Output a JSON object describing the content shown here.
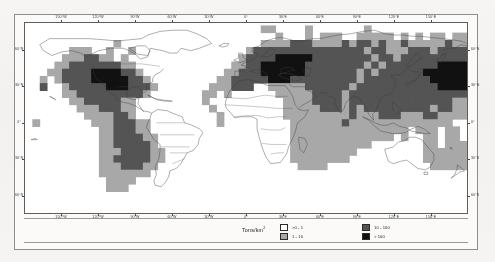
{
  "figure": {
    "legend_title": "Tons/km",
    "legend_title_sup": "2"
  },
  "legend": {
    "columns": [
      {
        "items": [
          {
            "label": ">0 - 1",
            "color": "#ffffff"
          },
          {
            "label": "1 - 10",
            "color": "#a8a8a8"
          }
        ]
      },
      {
        "items": [
          {
            "label": "10 - 100",
            "color": "#545454"
          },
          {
            "label": "> 100",
            "color": "#111111"
          }
        ]
      }
    ]
  },
  "axes": {
    "lon_ticks": [
      {
        "label": "150°W",
        "value": -150
      },
      {
        "label": "120°W",
        "value": -120
      },
      {
        "label": "90°W",
        "value": -90
      },
      {
        "label": "60°W",
        "value": -60
      },
      {
        "label": "30°W",
        "value": -30
      },
      {
        "label": "0°",
        "value": 0
      },
      {
        "label": "30°E",
        "value": 30
      },
      {
        "label": "60°E",
        "value": 60
      },
      {
        "label": "90°E",
        "value": 90
      },
      {
        "label": "120°E",
        "value": 120
      },
      {
        "label": "150°E",
        "value": 150
      }
    ],
    "lat_ticks": [
      {
        "label": "60°N",
        "value": 60
      },
      {
        "label": "30°N",
        "value": 30
      },
      {
        "label": "0°",
        "value": 0
      },
      {
        "label": "30°S",
        "value": -30
      },
      {
        "label": "60°S",
        "value": -60
      }
    ],
    "xlim": [
      -180,
      180
    ],
    "ylim": [
      -75,
      83
    ]
  },
  "chart_data": {
    "type": "heatmap",
    "title": "",
    "subtitle": "",
    "xlabel": "Longitude",
    "ylabel": "Latitude",
    "zlabel": "Tons/km2",
    "grid": true,
    "legend_position": "bottom-center",
    "projection": "equirectangular",
    "cell_size_deg": 6,
    "xlim": [
      -180,
      180
    ],
    "ylim": [
      -75,
      83
    ],
    "classes": [
      {
        "label": ">0 - 1",
        "min": 0,
        "max": 1,
        "color": "#ffffff"
      },
      {
        "label": "1 - 10",
        "min": 1,
        "max": 10,
        "color": "#a8a8a8"
      },
      {
        "label": "10 - 100",
        "min": 10,
        "max": 100,
        "color": "#545454"
      },
      {
        "label": "> 100",
        "min": 100,
        "max": null,
        "color": "#111111"
      }
    ],
    "background_color": "#ffffff",
    "coastline_color": "#3c3c3c",
    "regions": [
      {
        "name": "Eastern North America",
        "class": "> 100"
      },
      {
        "name": "Western Europe",
        "class": "> 100"
      },
      {
        "name": "Central Europe",
        "class": "> 100"
      },
      {
        "name": "Eastern China",
        "class": "> 100"
      },
      {
        "name": "Japan / Korea",
        "class": "> 100"
      },
      {
        "name": "Western North America",
        "class": "10 - 100"
      },
      {
        "name": "Russia / Siberia",
        "class": "10 - 100"
      },
      {
        "name": "India",
        "class": "10 - 100"
      },
      {
        "name": "Middle East",
        "class": "10 - 100"
      },
      {
        "name": "Mexico / Central America",
        "class": "10 - 100"
      },
      {
        "name": "Southeast Asia",
        "class": "10 - 100"
      },
      {
        "name": "Southern Brazil / Argentina",
        "class": "1 - 10"
      },
      {
        "name": "Sub-Saharan Africa",
        "class": "1 - 10"
      },
      {
        "name": "Australia",
        "class": "1 - 10"
      },
      {
        "name": "Amazon Basin",
        "class": ">0 - 1"
      },
      {
        "name": "Sahara",
        "class": ">0 - 1"
      },
      {
        "name": "Greenland",
        "class": ">0 - 1"
      }
    ],
    "grid_rows": [
      {
        "lat": 78,
        "cells": "................................oo....o.......o.............oo....................."
      },
      {
        "lat": 72,
        "cells": "..................................o...o.ooo..ooooo.o.o.oo.ooo......o.o..........."
      },
      {
        "lat": 66,
        "cells": "............o...................ooooXXXooooXoXXoXooXoooooXoooo..oo.o............."
      },
      {
        "lat": 60,
        "cells": "......ooo..o..o...............oXXXXXXXXXXXXXXXoXXoooXXXoXXXXXoo.o.oo............."
      },
      {
        "lat": 54,
        "cells": ".....oooXXoo.o...............oXXXXMMMMMXXXXXXXXoXXoXXXXXXXXXXXXo.ooo............."
      },
      {
        "lat": 48,
        "cells": "....ooXXXXXXXoo.............ooXXMMMMMMXXXXXXXXoXoXXXXXXXMMMMXXXoo..o............."
      },
      {
        "lat": 42,
        "cells": "...ooXXXXMMMMXXo...........ooXXXMMMMMMXXXXXXXoXoXXXXXXMMMMMMMMXXoo.............."
      },
      {
        "lat": 36,
        "cells": "..o.oXXXXMMMMMXXo.........ooXXXXXMMMXXXXXXXXXoXXXXXXXXXMMMMMMMMMXoo............."
      },
      {
        "lat": 30,
        "cells": "..X..oXXXXXMMMXXXo.......oooXXX..oooooXXXXXXoXXXXXXXXXXXMMMMMMXXoo.............."
      },
      {
        "lat": 24,
        "cells": ".....ooXXXXXXXXXo.......oo.o......oooooXXXXoXXXXXXXXXXXXXXXXXoo.o..............."
      },
      {
        "lat": 18,
        "cells": "......ooXXXXXoo.........o..........ooooXXXXoXXXXXXXXXXXXXXoo..o................."
      },
      {
        "lat": 12,
        "cells": ".......oooXXXoo..........o.........oooooXXXoXoXXXXXXXXXoXXoo...................."
      },
      {
        "lat": 6,
        "cells": "........ooooXXo...........o........oooooooooXoooXXXoooXXoooo...................."
      },
      {
        "lat": 0,
        "cells": ".o.......oooXXXoo.........o.........oooooooXoooooooooooooo..o..................."
      },
      {
        "lat": -6,
        "cells": "..........ooXXXoo...................oooooooooooooooo.ooo.oo....................."
      },
      {
        "lat": -12,
        "cells": "..........ooXXXXoo..................oooooooooooooo.o..oo.oo..o.................."
      },
      {
        "lat": -18,
        "cells": "..........ooXXXXXo..................ooooooooooo.......oo.oooooooo..............."
      },
      {
        "lat": -24,
        "cells": "..........oooXXXXoo.................ooooooooo.........oooooooooXo.o............."
      },
      {
        "lat": -30,
        "cells": "..........ooXXXXXoo.................oooooooo..........ooooooooXXo..............."
      },
      {
        "lat": -36,
        "cells": "..........oooXXXoo...................oooo..............ooooooooo.o.............."
      },
      {
        "lat": -42,
        "cells": "..........ooooooo.............................................o................."
      },
      {
        "lat": -48,
        "cells": "...........oooo................................................................."
      },
      {
        "lat": -54,
        "cells": "...........ooo.................................................................."
      },
      {
        "lat": -60,
        "cells": "..............................................................................."
      },
      {
        "lat": -66,
        "cells": "..............................................................................."
      },
      {
        "lat": -72,
        "cells": "..............................................................................."
      }
    ],
    "grid_legend": {
      ".": "no data / ocean",
      "o": "1 - 10",
      "X": "10 - 100",
      "M": "> 100"
    }
  }
}
